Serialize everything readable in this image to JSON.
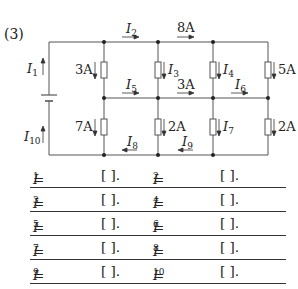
{
  "problem_number": "(3)",
  "circuit": {
    "labels": {
      "I1": "I",
      "I1_sub": "1",
      "I10": "I",
      "I10_sub": "10",
      "I2": "I",
      "I2_sub": "2",
      "top_mid": "8A",
      "r_left_top": "3A",
      "I3": "I",
      "I3_sub": "3",
      "I4": "I",
      "I4_sub": "4",
      "r_right_top": "5A",
      "I5": "I",
      "I5_sub": "5",
      "mid_mid": "3A",
      "I6": "I",
      "I6_sub": "6",
      "r_left_bot": "7A",
      "r_mid_bot": "2A",
      "I7": "I",
      "I7_sub": "7",
      "r_right_bot": "2A",
      "I8": "I",
      "I8_sub": "8",
      "I9": "I",
      "I9_sub": "9"
    }
  },
  "answers": [
    {
      "left": {
        "var": "I",
        "sub": "1",
        "eq": "=",
        "blank": "[        ]."
      },
      "right": {
        "var": "I",
        "sub": "2",
        "eq": "=",
        "blank": "[        ]."
      }
    },
    {
      "left": {
        "var": "I",
        "sub": "3",
        "eq": "=",
        "blank": "[        ]."
      },
      "right": {
        "var": "I",
        "sub": "4",
        "eq": "=",
        "blank": "[        ]."
      }
    },
    {
      "left": {
        "var": "I",
        "sub": "5",
        "eq": "=",
        "blank": "[        ]."
      },
      "right": {
        "var": "I",
        "sub": "6",
        "eq": "=",
        "blank": "[        ]."
      }
    },
    {
      "left": {
        "var": "I",
        "sub": "7",
        "eq": "=",
        "blank": "[        ]."
      },
      "right": {
        "var": "I",
        "sub": "8",
        "eq": "=",
        "blank": "[        ]."
      }
    },
    {
      "left": {
        "var": "I",
        "sub": "9",
        "eq": "=",
        "blank": "[        ]."
      },
      "right": {
        "var": "I",
        "sub": "10",
        "eq": "=",
        "blank": "[        ]."
      }
    }
  ]
}
